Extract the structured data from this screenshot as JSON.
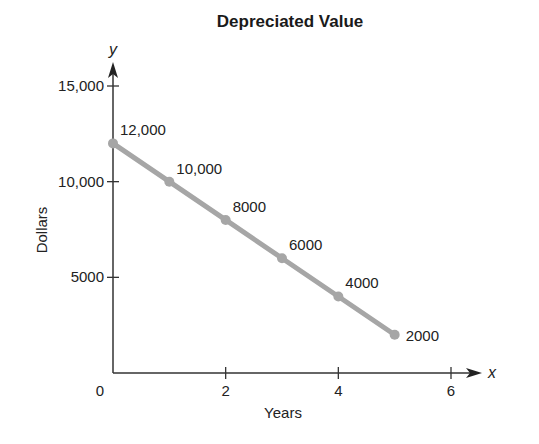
{
  "chart_data": {
    "type": "line",
    "title": "Depreciated Value",
    "xlabel": "Years",
    "ylabel": "Dollars",
    "x_axis_variable": "x",
    "y_axis_variable": "y",
    "x": [
      0,
      1,
      2,
      3,
      4,
      5
    ],
    "series": [
      {
        "name": "Depreciated Value",
        "values": [
          12000,
          10000,
          8000,
          6000,
          4000,
          2000
        ],
        "labels": [
          "12,000",
          "10,000",
          "8000",
          "6000",
          "4000",
          "2000"
        ],
        "color": "#a6a6a6"
      }
    ],
    "x_ticks": [
      0,
      2,
      4,
      6
    ],
    "x_tick_labels": [
      "0",
      "2",
      "4",
      "6"
    ],
    "y_ticks": [
      5000,
      10000,
      15000
    ],
    "y_tick_labels": [
      "5000",
      "10,000",
      "15,000"
    ],
    "xlim": [
      0,
      6
    ],
    "ylim": [
      0,
      15000
    ],
    "grid": false,
    "legend": "none"
  }
}
